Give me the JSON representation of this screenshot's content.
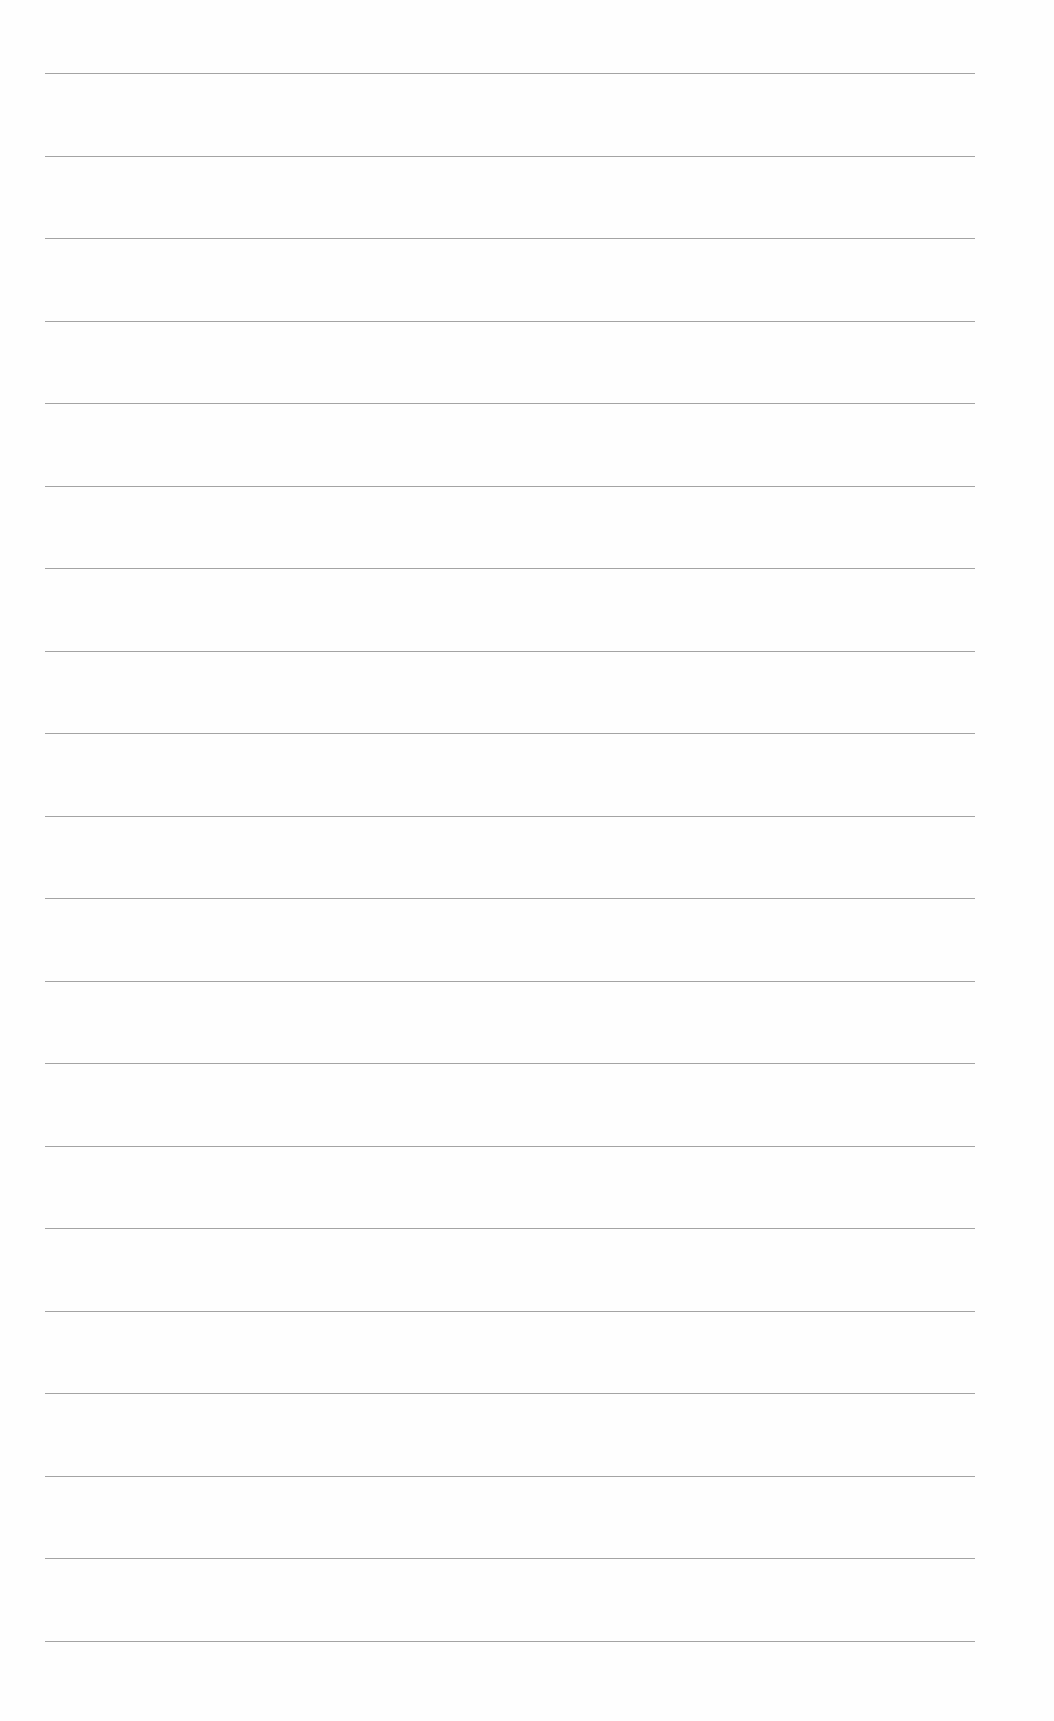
{
  "document": {
    "type": "lined-paper",
    "line_count": 20,
    "first_line_y": 73,
    "line_spacing": 82.5,
    "line_left": 45,
    "line_width": 930,
    "line_color": "#9a9a9a",
    "background": "#fefefe"
  }
}
